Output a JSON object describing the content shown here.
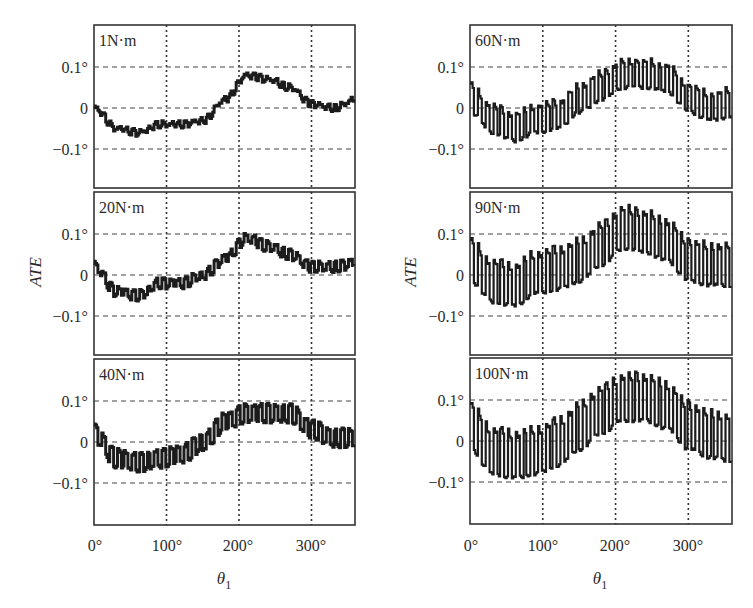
{
  "figure": {
    "columns": [
      {
        "ylabel": "ATE",
        "xlabel": "θ",
        "xlabel_sub": "1",
        "xticks": [
          "0°",
          "100°",
          "200°",
          "300°"
        ]
      },
      {
        "ylabel": "ATE",
        "xlabel": "θ",
        "xlabel_sub": "1",
        "xticks": [
          "0°",
          "100°",
          "200°",
          "300°"
        ]
      }
    ],
    "yticks": [
      "0.1°",
      "0",
      "−0.1°"
    ]
  },
  "chart_data": [
    {
      "type": "line",
      "title": "1N·m",
      "xlabel": "θ1",
      "ylabel": "ATE",
      "xlim": [
        0,
        360
      ],
      "ylim": [
        -0.2,
        0.2
      ],
      "xticks": [
        0,
        100,
        200,
        300
      ],
      "yticks": [
        -0.1,
        0,
        0.1
      ],
      "grid": true,
      "x": [
        0,
        30,
        60,
        90,
        120,
        150,
        180,
        210,
        240,
        270,
        300,
        330,
        360
      ],
      "values": [
        0.0,
        -0.05,
        -0.06,
        -0.04,
        -0.04,
        -0.03,
        0.02,
        0.08,
        0.07,
        0.05,
        0.01,
        0.0,
        0.02
      ],
      "ripple_amplitude": 0.005,
      "ripple_period_deg": 10.3
    },
    {
      "type": "line",
      "title": "20N·m",
      "xlabel": "θ1",
      "ylabel": "ATE",
      "xlim": [
        0,
        360
      ],
      "ylim": [
        -0.2,
        0.2
      ],
      "xticks": [
        0,
        100,
        200,
        300
      ],
      "yticks": [
        -0.1,
        0,
        0.1
      ],
      "grid": true,
      "x": [
        0,
        30,
        60,
        90,
        120,
        150,
        180,
        210,
        240,
        270,
        300,
        330,
        360
      ],
      "values": [
        0.02,
        -0.04,
        -0.05,
        -0.02,
        -0.02,
        0.0,
        0.04,
        0.09,
        0.07,
        0.05,
        0.02,
        0.02,
        0.03
      ],
      "ripple_amplitude": 0.01,
      "ripple_period_deg": 10.3
    },
    {
      "type": "line",
      "title": "40N·m",
      "xlabel": "θ1",
      "ylabel": "ATE",
      "xlim": [
        0,
        360
      ],
      "ylim": [
        -0.2,
        0.2
      ],
      "xticks": [
        0,
        100,
        200,
        300
      ],
      "yticks": [
        -0.1,
        0,
        0.1
      ],
      "grid": true,
      "x": [
        0,
        30,
        60,
        90,
        120,
        150,
        180,
        210,
        240,
        270,
        300,
        330,
        360
      ],
      "values": [
        0.02,
        -0.04,
        -0.05,
        -0.04,
        -0.03,
        0.0,
        0.05,
        0.07,
        0.07,
        0.07,
        0.03,
        0.01,
        0.01
      ],
      "ripple_amplitude": 0.02,
      "ripple_period_deg": 10.3
    },
    {
      "type": "line",
      "title": "60N·m",
      "xlabel": "θ1",
      "ylabel": "ATE",
      "xlim": [
        0,
        360
      ],
      "ylim": [
        -0.2,
        0.2
      ],
      "xticks": [
        0,
        100,
        200,
        300
      ],
      "yticks": [
        -0.1,
        0,
        0.1
      ],
      "grid": true,
      "x": [
        0,
        30,
        60,
        90,
        120,
        150,
        180,
        210,
        240,
        270,
        300,
        330,
        360
      ],
      "values": [
        0.02,
        -0.03,
        -0.05,
        -0.03,
        -0.02,
        0.02,
        0.05,
        0.08,
        0.08,
        0.07,
        0.02,
        0.0,
        0.01
      ],
      "ripple_amplitude": 0.03,
      "ripple_period_deg": 10.3
    },
    {
      "type": "line",
      "title": "90N·m",
      "xlabel": "θ1",
      "ylabel": "ATE",
      "xlim": [
        0,
        360
      ],
      "ylim": [
        -0.2,
        0.2
      ],
      "xticks": [
        0,
        100,
        200,
        300
      ],
      "yticks": [
        -0.1,
        0,
        0.1
      ],
      "grid": true,
      "x": [
        0,
        30,
        60,
        90,
        120,
        150,
        180,
        210,
        240,
        270,
        300,
        330,
        360
      ],
      "values": [
        0.03,
        -0.02,
        -0.03,
        0.0,
        0.01,
        0.03,
        0.07,
        0.11,
        0.1,
        0.08,
        0.03,
        0.02,
        0.02
      ],
      "ripple_amplitude": 0.045,
      "ripple_period_deg": 10.3
    },
    {
      "type": "line",
      "title": "100N·m",
      "xlabel": "θ1",
      "ylabel": "ATE",
      "xlim": [
        0,
        360
      ],
      "ylim": [
        -0.2,
        0.2
      ],
      "xticks": [
        0,
        100,
        200,
        300
      ],
      "yticks": [
        -0.1,
        0,
        0.1
      ],
      "grid": true,
      "x": [
        0,
        30,
        60,
        90,
        120,
        150,
        180,
        210,
        240,
        270,
        300,
        330,
        360
      ],
      "values": [
        0.03,
        -0.03,
        -0.04,
        -0.03,
        -0.01,
        0.03,
        0.07,
        0.1,
        0.1,
        0.08,
        0.03,
        0.01,
        0.0
      ],
      "ripple_amplitude": 0.05,
      "ripple_period_deg": 10.3
    }
  ]
}
